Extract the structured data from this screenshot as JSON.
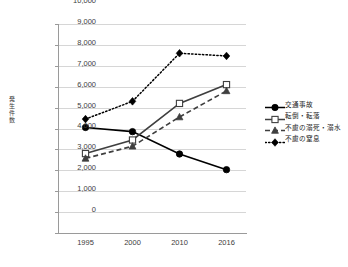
{
  "chart_data": {
    "type": "line",
    "title": "",
    "xlabel": "",
    "ylabel": "発生件数",
    "categories": [
      "1995",
      "2000",
      "2010",
      "2016"
    ],
    "ylim": [
      0,
      10000
    ],
    "ytick_labels": [
      "10,000",
      "9,000",
      "8,000",
      "7,000",
      "6,000",
      "5,000",
      "4,000",
      "3,000",
      "2,000",
      "1,000",
      "0"
    ],
    "ytick_values": [
      10000,
      9000,
      8000,
      7000,
      6000,
      5000,
      4000,
      3000,
      2000,
      1000,
      0
    ],
    "grid": true,
    "legend_position": "right",
    "series": [
      {
        "name": "交通事故",
        "values": [
          5050,
          4850,
          3780,
          3030
        ],
        "marker": "filled-circle",
        "line_style": "solid",
        "color": "#000000"
      },
      {
        "name": "転倒・転落",
        "values": [
          3800,
          4450,
          6200,
          7100
        ],
        "marker": "open-square",
        "line_style": "solid",
        "color": "#3f3f3f"
      },
      {
        "name": "不慮の溺死・溺水",
        "values": [
          3570,
          4150,
          5550,
          6800
        ],
        "marker": "filled-triangle",
        "line_style": "dashed",
        "color": "#3f3f3f"
      },
      {
        "name": "不慮の窒息",
        "values": [
          5450,
          6300,
          8600,
          8470
        ],
        "marker": "filled-diamond",
        "line_style": "dotted",
        "color": "#000000"
      }
    ]
  }
}
